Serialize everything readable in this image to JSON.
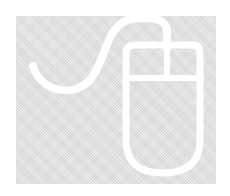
{
  "image": {
    "subject": "computer-mouse-illustration",
    "colors": {
      "background": "#ffffff",
      "panel": "#e4e4e4",
      "stroke": "#ffffff"
    }
  }
}
